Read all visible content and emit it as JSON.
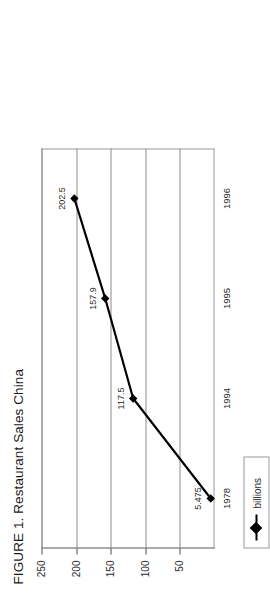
{
  "figure": {
    "title": "FIGURE 1. Restaurant Sales China",
    "orientation_note": "rotated"
  },
  "legend": {
    "series_label": "billions",
    "marker": "diamond-marker"
  },
  "chart_data": {
    "type": "line",
    "title": "FIGURE 1. Restaurant Sales China",
    "xlabel": "",
    "ylabel": "",
    "categories": [
      "1978",
      "1994",
      "1995",
      "1996"
    ],
    "values": [
      5.475,
      117.5,
      157.9,
      202.5
    ],
    "point_labels": [
      "5.475",
      "117.5",
      "157.9",
      "202.5"
    ],
    "series": [
      {
        "name": "billions",
        "values": [
          5.475,
          117.5,
          157.9,
          202.5
        ],
        "color": "#000000",
        "marker": "diamond"
      }
    ],
    "ylim": [
      0,
      250
    ],
    "yticks": [
      50,
      100,
      150,
      200,
      250
    ],
    "ytick_labels": [
      "50",
      "100",
      "150",
      "200",
      "250"
    ],
    "grid": true,
    "legend_position": "bottom-left"
  },
  "axis": {
    "y_ticks": [
      {
        "value": 250,
        "label": "250"
      },
      {
        "value": 200,
        "label": "200"
      },
      {
        "value": 150,
        "label": "150"
      },
      {
        "value": 100,
        "label": "100"
      },
      {
        "value": 50,
        "label": "50"
      }
    ],
    "x_ticks": [
      {
        "label": "1978"
      },
      {
        "label": "1994"
      },
      {
        "label": "1995"
      },
      {
        "label": "1996"
      }
    ]
  },
  "colors": {
    "series": "#000000",
    "grid": "#8c8c8c",
    "axis": "#5a5a5a",
    "text": "#2b2b2b",
    "background": "#ffffff"
  }
}
